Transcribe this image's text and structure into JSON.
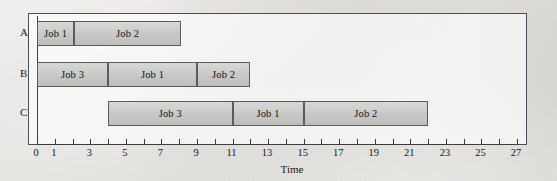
{
  "chart_data": {
    "type": "bar",
    "subtype": "gantt",
    "title": "",
    "xlabel": "Time",
    "ylabel": "",
    "xlim": [
      0,
      27
    ],
    "grid": false,
    "legend": "none",
    "tick_step": 1,
    "labeled_ticks": [
      0,
      1,
      3,
      5,
      7,
      9,
      11,
      13,
      15,
      17,
      19,
      21,
      23,
      25,
      27
    ],
    "tick_labels": [
      "0",
      "1",
      "3",
      "5",
      "7",
      "9",
      "11",
      "13",
      "15",
      "17",
      "19",
      "21",
      "23",
      "25",
      "27"
    ],
    "machines": [
      "A",
      "B",
      "C"
    ],
    "rows": [
      {
        "label": "A",
        "tasks": [
          {
            "name": "Job 1",
            "start": 0,
            "end": 2.1
          },
          {
            "name": "Job 2",
            "start": 2.1,
            "end": 8.1
          }
        ]
      },
      {
        "label": "B",
        "tasks": [
          {
            "name": "Job 3",
            "start": 0,
            "end": 4
          },
          {
            "name": "Job 1",
            "start": 4,
            "end": 9
          },
          {
            "name": "Job 2",
            "start": 9,
            "end": 12
          }
        ]
      },
      {
        "label": "C",
        "tasks": [
          {
            "name": "Job 3",
            "start": 4,
            "end": 11
          },
          {
            "name": "Job 1",
            "start": 11,
            "end": 15
          },
          {
            "name": "Job 2",
            "start": 15,
            "end": 22
          }
        ]
      }
    ],
    "colors": {
      "bar_fill_top": "#d8d8d6",
      "bar_fill_bottom": "#bdbdbb",
      "bar_border": "#5a5a60",
      "axis": "#3c3c41",
      "frame": "#4b4b50",
      "text": "#17171a",
      "background": "#d9d7d2"
    }
  }
}
